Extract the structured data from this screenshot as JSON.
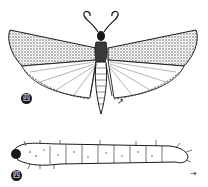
{
  "figure": {
    "subjects": [
      {
        "name": "adult-moth",
        "label": "四",
        "arrow": "↗"
      },
      {
        "name": "larva",
        "label": "四",
        "arrow": "→"
      }
    ],
    "colors": {
      "ink": "#1a1a1a",
      "paper": "#ffffff",
      "shade": "#6b6b6b"
    }
  }
}
